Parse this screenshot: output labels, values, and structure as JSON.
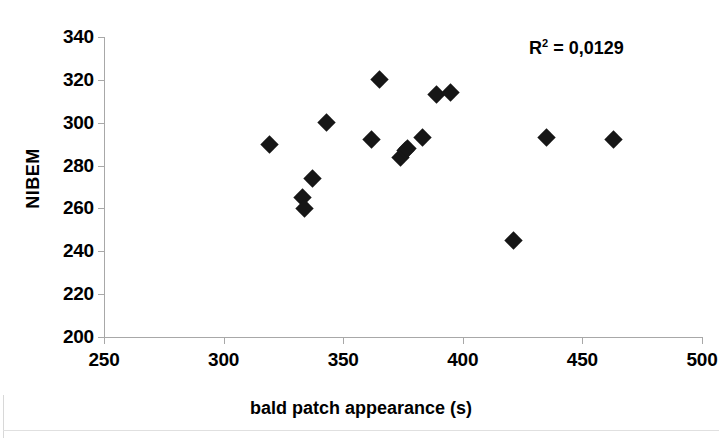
{
  "chart_data": {
    "type": "scatter",
    "title": "",
    "xlabel": "bald patch appearance (s)",
    "ylabel": "NIBEM",
    "xlim": [
      250,
      500
    ],
    "ylim": [
      200,
      340
    ],
    "xticks": [
      250,
      300,
      350,
      400,
      450,
      500
    ],
    "yticks": [
      200,
      220,
      240,
      260,
      280,
      300,
      320,
      340
    ],
    "grid": false,
    "legend": null,
    "annotations": [
      {
        "name": "r-squared",
        "prefix": "R",
        "superscript": "2",
        "text": " = 0,0129",
        "full_text": "R2 = 0,0129",
        "value": 0.0129
      }
    ],
    "series": [
      {
        "name": "NIBEM vs bald patch appearance",
        "marker": "diamond",
        "color": "#161616",
        "points": [
          {
            "x": 319,
            "y": 290
          },
          {
            "x": 333,
            "y": 265
          },
          {
            "x": 334,
            "y": 260
          },
          {
            "x": 337,
            "y": 274
          },
          {
            "x": 343,
            "y": 300
          },
          {
            "x": 362,
            "y": 292
          },
          {
            "x": 365,
            "y": 320
          },
          {
            "x": 374,
            "y": 284
          },
          {
            "x": 376,
            "y": 287
          },
          {
            "x": 377,
            "y": 288
          },
          {
            "x": 383,
            "y": 293
          },
          {
            "x": 389,
            "y": 313
          },
          {
            "x": 395,
            "y": 314
          },
          {
            "x": 421,
            "y": 245
          },
          {
            "x": 435,
            "y": 293
          },
          {
            "x": 463,
            "y": 292
          }
        ]
      }
    ]
  }
}
